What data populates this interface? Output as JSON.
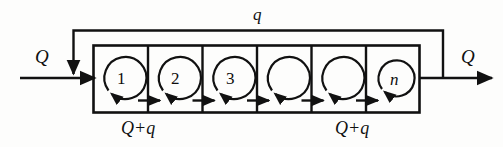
{
  "figure": {
    "name": "tanks-in-series-with-recycle",
    "colors": {
      "line": "#111111",
      "background": "#fdfdfc",
      "text": "#101010"
    }
  },
  "labels": {
    "inlet_flow": "Q",
    "outlet_flow": "Q",
    "recycle_flow": "q",
    "internal_flow_left": "Q+q",
    "internal_flow_right": "Q+q"
  },
  "cells": [
    {
      "id": "cell-1",
      "label": "1",
      "style": "upright"
    },
    {
      "id": "cell-2",
      "label": "2",
      "style": "upright"
    },
    {
      "id": "cell-3",
      "label": "3",
      "style": "upright"
    },
    {
      "id": "cell-4",
      "label": "",
      "style": "upright"
    },
    {
      "id": "cell-5",
      "label": "",
      "style": "upright"
    },
    {
      "id": "cell-n",
      "label": "n",
      "style": "italic"
    }
  ],
  "streams": [
    {
      "id": "inlet",
      "label": "Q",
      "direction": "right"
    },
    {
      "id": "outlet",
      "label": "Q",
      "direction": "right"
    },
    {
      "id": "recycle",
      "label": "q",
      "direction": "leftward-then-down"
    },
    {
      "id": "internal",
      "label": "Q+q",
      "direction": "right"
    }
  ]
}
